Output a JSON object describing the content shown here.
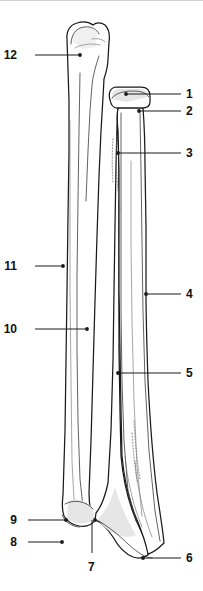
{
  "figure": {
    "view": "anterior",
    "background_color": "#ffffff",
    "line_color": "#1a1a1a",
    "shade_color": "#e6e6e6",
    "width_px": 203,
    "height_px": 591
  },
  "labels": [
    {
      "id": "1",
      "text": "1",
      "side": "right",
      "num_x": 186,
      "num_y": 87,
      "line_x1": 126,
      "line_x2": 181,
      "line_y": 93,
      "dot_x": 126,
      "dot_y": 93,
      "has_dot": true
    },
    {
      "id": "2",
      "text": "2",
      "side": "right",
      "num_x": 186,
      "num_y": 104,
      "line_x1": 139,
      "line_x2": 181,
      "line_y": 110,
      "dot_x": 139,
      "dot_y": 110,
      "has_dot": true
    },
    {
      "id": "3",
      "text": "3",
      "side": "right",
      "num_x": 186,
      "num_y": 146,
      "line_x1": 118,
      "line_x2": 181,
      "line_y": 152,
      "dot_x": 118,
      "dot_y": 152,
      "has_dot": true
    },
    {
      "id": "4",
      "text": "4",
      "side": "right",
      "num_x": 186,
      "num_y": 287,
      "line_x1": 146,
      "line_x2": 181,
      "line_y": 293,
      "dot_x": 146,
      "dot_y": 293,
      "has_dot": true
    },
    {
      "id": "5",
      "text": "5",
      "side": "right",
      "num_x": 186,
      "num_y": 366,
      "line_x1": 118,
      "line_x2": 181,
      "line_y": 372,
      "dot_x": 118,
      "dot_y": 372,
      "has_dot": true
    },
    {
      "id": "6",
      "text": "6",
      "side": "right",
      "num_x": 186,
      "num_y": 551,
      "line_x1": 143,
      "line_x2": 181,
      "line_y": 557,
      "dot_x": 143,
      "dot_y": 557,
      "has_dot": true
    },
    {
      "id": "7",
      "text": "7",
      "side": "below",
      "num_x": 88,
      "num_y": 560,
      "line_x1": 92,
      "line_x2": 92,
      "line_y": 0,
      "dot_x": 95,
      "dot_y": 519,
      "has_dot": true
    },
    {
      "id": "8",
      "text": "8",
      "side": "left",
      "num_x": 17,
      "num_y": 535,
      "line_x1": 28,
      "line_x2": 62,
      "line_y": 541,
      "dot_x": 62,
      "dot_y": 541,
      "has_dot": true
    },
    {
      "id": "9",
      "text": "9",
      "side": "left",
      "num_x": 17,
      "num_y": 513,
      "line_x1": 28,
      "line_x2": 66,
      "line_y": 519,
      "dot_x": 66,
      "dot_y": 519,
      "has_dot": true
    },
    {
      "id": "10",
      "text": "10",
      "side": "left",
      "num_x": 17,
      "num_y": 322,
      "line_x1": 35,
      "line_x2": 87,
      "line_y": 328,
      "dot_x": 87,
      "dot_y": 328,
      "has_dot": true
    },
    {
      "id": "11",
      "text": "11",
      "side": "left",
      "num_x": 17,
      "num_y": 259,
      "line_x1": 35,
      "line_x2": 63,
      "line_y": 265,
      "dot_x": 63,
      "dot_y": 265,
      "has_dot": true
    },
    {
      "id": "12",
      "text": "12",
      "side": "left",
      "num_x": 17,
      "num_y": 48,
      "line_x1": 35,
      "line_x2": 80,
      "line_y": 54,
      "dot_x": 80,
      "dot_y": 54,
      "has_dot": true
    }
  ],
  "leader_7": {
    "vertical_x": 92,
    "top_y": 519,
    "bottom_y": 552
  }
}
